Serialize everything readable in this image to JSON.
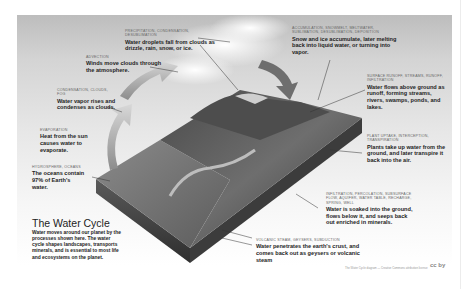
{
  "title": "The Water Cycle",
  "intro": "Water moves around our planet by the processes shown here. The water cycle shapes landscapes, transports minerals, and is essential to most life and ecosystems on the planet.",
  "labels": [
    {
      "id": "precipitation",
      "caption": "Precipitation, condensation, desublimation",
      "text": "Water droplets fall from clouds as drizzle, rain, snow, or ice."
    },
    {
      "id": "advection",
      "caption": "Advection",
      "text": "Winds move clouds through the atmosphere."
    },
    {
      "id": "condensation",
      "caption": "Condensation, clouds, fog",
      "text": "Water vapor rises and condenses as clouds."
    },
    {
      "id": "evaporation",
      "caption": "Evaporation",
      "text": "Heat from the sun causes water to evaporate."
    },
    {
      "id": "oceans",
      "caption": "Hydrosphere, oceans",
      "text": "The oceans contain 97% of Earth's water."
    },
    {
      "id": "accumulation",
      "caption": "Accumulation, snowmelt, meltwater, sublimation, desublimation, deposition",
      "text": "Snow and ice accumulate, later melting back into liquid water, or turning into vapor."
    },
    {
      "id": "surface-runoff",
      "caption": "Surface runoff, streams, runoff, infiltration",
      "text": "Water flows above ground as runoff, forming streams, rivers, swamps, ponds, and lakes."
    },
    {
      "id": "plant-uptake",
      "caption": "Plant uptake, interception, transpiration",
      "text": "Plants take up water from the ground, and later transpire it back into the air."
    },
    {
      "id": "infiltration",
      "caption": "Infiltration, percolation, subsurface flow, aquifer, water table, recharge, spring, well",
      "text": "Water is soaked into the ground, flows below it, and seeps back out enriched in minerals."
    },
    {
      "id": "volcanic",
      "caption": "Volcanic steam, geysers, subduction",
      "text": "Water penetrates the earth's crust, and comes back out as geysers or volcanic steam"
    }
  ],
  "footer": {
    "credit": "The Water Cycle diagram — Creative Commons attribution license",
    "logo": "cc by"
  },
  "colors": {
    "sky_top": "#bdbdbd",
    "terrain_dark": "#3a3a3a",
    "terrain_mid": "#6b6b6b",
    "ocean": "#7d7d7d",
    "arrow": "#9a9a9a"
  }
}
